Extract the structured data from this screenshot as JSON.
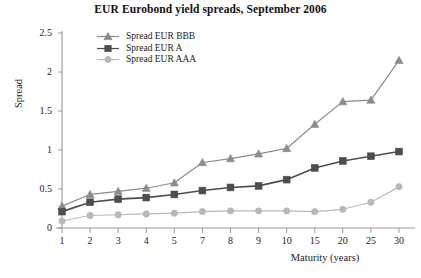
{
  "chart_data": {
    "type": "line",
    "title": "EUR Eurobond yield spreads, September 2006",
    "xlabel": "Maturity (years)",
    "ylabel": "Spread",
    "categories": [
      "1",
      "2",
      "3",
      "4",
      "5",
      "7",
      "8",
      "9",
      "10",
      "15",
      "20",
      "25",
      "30"
    ],
    "ylim": [
      0,
      2.5
    ],
    "yticks": [
      "0",
      "0.5",
      "1",
      "1.5",
      "2",
      "2.5"
    ],
    "ytick_values": [
      0,
      0.5,
      1,
      1.5,
      2,
      2.5
    ],
    "grid": false,
    "legend_position": "top-left-inside",
    "series": [
      {
        "name": "Spread EUR BBB",
        "marker": "triangle",
        "color": "#8c8c8c",
        "values": [
          0.28,
          0.43,
          0.47,
          0.51,
          0.58,
          0.84,
          0.89,
          0.95,
          1.02,
          1.33,
          1.62,
          1.64,
          2.15
        ]
      },
      {
        "name": "Spread EUR A",
        "marker": "square",
        "color": "#4d4d4d",
        "values": [
          0.21,
          0.33,
          0.37,
          0.39,
          0.43,
          0.48,
          0.52,
          0.54,
          0.62,
          0.77,
          0.86,
          0.92,
          0.98
        ]
      },
      {
        "name": "Spread EUR AAA",
        "marker": "circle",
        "color": "#b8b8b8",
        "values": [
          0.09,
          0.16,
          0.17,
          0.18,
          0.19,
          0.21,
          0.22,
          0.22,
          0.22,
          0.21,
          0.24,
          0.33,
          0.53
        ]
      }
    ]
  },
  "axes": {
    "axis_color": "#9a9a9a"
  }
}
